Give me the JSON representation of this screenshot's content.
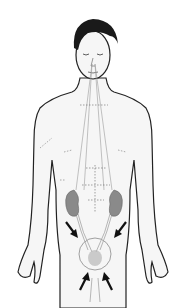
{
  "figure": {
    "elements": [
      "head",
      "torso",
      "arms",
      "meridian-lines",
      "kidneys",
      "ureters",
      "bladder-circle",
      "arrows"
    ],
    "arrow_count": 4,
    "colors": {
      "background": "#ffffff",
      "outline": "#222222",
      "hair": "#1a1a1a",
      "skin": "#f4f4f4",
      "kidney": "#8a8a8a",
      "lines": "#9a9a9a",
      "circle": "#a0a0a0",
      "arrow": "#111111"
    }
  }
}
